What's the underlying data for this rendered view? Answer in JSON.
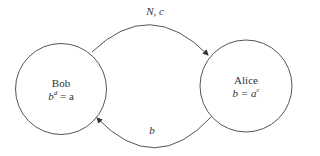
{
  "nodes": [
    {
      "id": "bob",
      "name": "Bob",
      "eq_base": "b",
      "eq_exp": "d",
      "eq_rhs": " = a"
    },
    {
      "id": "alice",
      "name": "Alice",
      "eq_lhs": "b = ",
      "eq_base": "a",
      "eq_exp": "c"
    }
  ],
  "edges": [
    {
      "from": "bob",
      "to": "alice",
      "label": "N, c"
    },
    {
      "from": "alice",
      "to": "bob",
      "label": "b"
    }
  ],
  "colors": {
    "stroke": "#555555",
    "text": "#333333"
  }
}
